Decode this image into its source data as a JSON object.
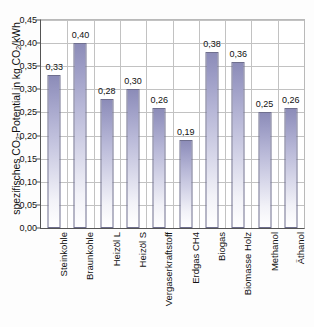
{
  "chart_data": {
    "type": "bar",
    "title": "",
    "xlabel": "",
    "ylabel": "spezifisches CO2-Potential in kg CO2/kWh",
    "ylabel_parts": {
      "pre": "spezifisches CO",
      "sub1": "2",
      "mid": "-Potential in kg CO",
      "sub2": "2",
      "post": "/kWh"
    },
    "categories": [
      "Steinkohle",
      "Braunkohle",
      "Heizöl L",
      "Heizöl S",
      "Vergaserkraftstoff",
      "Erdgas CH4",
      "Biogas",
      "Biomasse Holz",
      "Methanol",
      "Äthanol"
    ],
    "values": [
      0.33,
      0.4,
      0.28,
      0.3,
      0.26,
      0.19,
      0.38,
      0.36,
      0.25,
      0.26
    ],
    "value_labels": [
      "0,33",
      "0,40",
      "0,28",
      "0,30",
      "0,26",
      "0,19",
      "0,38",
      "0,36",
      "0,25",
      "0,26"
    ],
    "ylim": [
      0.0,
      0.45
    ],
    "ytick_values": [
      0.0,
      0.05,
      0.1,
      0.15,
      0.2,
      0.25,
      0.3,
      0.35,
      0.4,
      0.45
    ],
    "ytick_labels": [
      "0,00",
      "0,05",
      "0,10",
      "0,15",
      "0,20",
      "0,25",
      "0,30",
      "0,35",
      "0,40",
      "0,45"
    ],
    "grid": {
      "horizontal": true,
      "vertical": true
    },
    "legend": {
      "visible": false,
      "position": "none"
    },
    "colors": {
      "bar_top": "#8c8cb8",
      "bar_bottom": "#ffffff",
      "bar_border": "#6f6f8e",
      "grid": "#c2c2c2",
      "axis": "#555555",
      "background": "#ffffff",
      "text": "#111111"
    }
  }
}
